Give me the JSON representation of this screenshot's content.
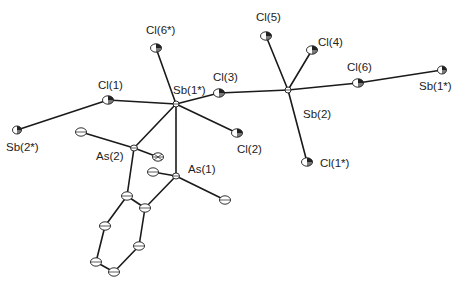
{
  "diagram": {
    "type": "ORTEP crystal structure",
    "atoms": [
      {
        "id": "sb2s",
        "label": "Sb(2*)",
        "x": 17,
        "y": 130,
        "lx": 6,
        "ly": 151
      },
      {
        "id": "cl1",
        "label": "Cl(1)",
        "x": 108,
        "y": 100,
        "lx": 98,
        "ly": 89
      },
      {
        "id": "sb1s",
        "label": "Sb(1*)",
        "x": 176,
        "y": 104,
        "lx": 173,
        "ly": 94
      },
      {
        "id": "cl6s",
        "label": "Cl(6*)",
        "x": 156,
        "y": 48,
        "lx": 146,
        "ly": 34
      },
      {
        "id": "cl3",
        "label": "Cl(3)",
        "x": 219,
        "y": 93,
        "lx": 213,
        "ly": 81
      },
      {
        "id": "cl2",
        "label": "Cl(2)",
        "x": 237,
        "y": 133,
        "lx": 237,
        "ly": 153
      },
      {
        "id": "sb2",
        "label": "Sb(2)",
        "x": 288,
        "y": 90,
        "lx": 303,
        "ly": 118
      },
      {
        "id": "cl5",
        "label": "Cl(5)",
        "x": 266,
        "y": 36,
        "lx": 256,
        "ly": 21
      },
      {
        "id": "cl4",
        "label": "Cl(4)",
        "x": 312,
        "y": 50,
        "lx": 318,
        "ly": 46
      },
      {
        "id": "cl6",
        "label": "Cl(6)",
        "x": 358,
        "y": 83,
        "lx": 347,
        "ly": 71
      },
      {
        "id": "sb1r",
        "label": "Sb(1*)",
        "x": 442,
        "y": 70,
        "lx": 419,
        "ly": 90
      },
      {
        "id": "cl1s",
        "label": "Cl(1*)",
        "x": 307,
        "y": 162,
        "lx": 320,
        "ly": 167
      },
      {
        "id": "as2",
        "label": "As(2)",
        "x": 134,
        "y": 148,
        "lx": 96,
        "ly": 160
      },
      {
        "id": "as1",
        "label": "As(1)",
        "x": 176,
        "y": 176,
        "lx": 188,
        "ly": 173
      },
      {
        "id": "c1",
        "label": "",
        "x": 81,
        "y": 132
      },
      {
        "id": "c2",
        "label": "",
        "x": 158,
        "y": 157
      },
      {
        "id": "c3",
        "label": "",
        "x": 153,
        "y": 172
      },
      {
        "id": "c4",
        "label": "",
        "x": 225,
        "y": 200
      },
      {
        "id": "r1",
        "label": "",
        "x": 127,
        "y": 196
      },
      {
        "id": "r2",
        "label": "",
        "x": 145,
        "y": 208
      },
      {
        "id": "r3",
        "label": "",
        "x": 105,
        "y": 226
      },
      {
        "id": "r4",
        "label": "",
        "x": 139,
        "y": 246
      },
      {
        "id": "r5",
        "label": "",
        "x": 96,
        "y": 262
      },
      {
        "id": "r6",
        "label": "",
        "x": 114,
        "y": 272
      }
    ],
    "bonds": [
      [
        "sb2s",
        "cl1"
      ],
      [
        "cl1",
        "sb1s"
      ],
      [
        "sb1s",
        "cl6s"
      ],
      [
        "sb1s",
        "cl3"
      ],
      [
        "sb1s",
        "cl2"
      ],
      [
        "cl3",
        "sb2"
      ],
      [
        "sb2",
        "cl5"
      ],
      [
        "sb2",
        "cl4"
      ],
      [
        "sb2",
        "cl6"
      ],
      [
        "cl6",
        "sb1r"
      ],
      [
        "sb2",
        "cl1s"
      ],
      [
        "sb1s",
        "as2"
      ],
      [
        "sb1s",
        "as1"
      ],
      [
        "as2",
        "c1"
      ],
      [
        "as2",
        "c2"
      ],
      [
        "as1",
        "c3"
      ],
      [
        "as1",
        "c4"
      ],
      [
        "as2",
        "r1"
      ],
      [
        "as1",
        "r2"
      ],
      [
        "r1",
        "r2"
      ],
      [
        "r1",
        "r3"
      ],
      [
        "r2",
        "r4"
      ],
      [
        "r3",
        "r5"
      ],
      [
        "r4",
        "r6"
      ],
      [
        "r5",
        "r6"
      ]
    ]
  },
  "labels": {
    "sb2s": "Sb(2*)",
    "cl1": "Cl(1)",
    "sb1s": "Sb(1*)",
    "cl6s": "Cl(6*)",
    "cl3": "Cl(3)",
    "cl2": "Cl(2)",
    "sb2": "Sb(2)",
    "cl5": "Cl(5)",
    "cl4": "Cl(4)",
    "cl6": "Cl(6)",
    "sb1r": "Sb(1*)",
    "cl1s": "Cl(1*)",
    "as2": "As(2)",
    "as1": "As(1)"
  }
}
